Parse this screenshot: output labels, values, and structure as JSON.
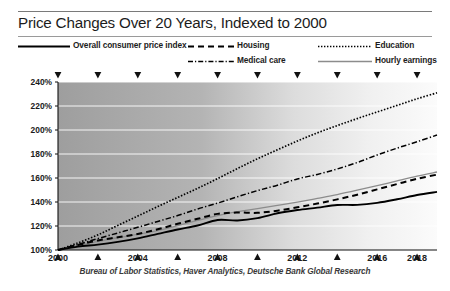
{
  "header": {
    "title": "Price Changes Over 20 Years, Indexed to 2000"
  },
  "legend": {
    "items": [
      {
        "key": "cpi",
        "label": "Overall consumer price index",
        "style": "solid-thick",
        "color": "#000000",
        "icon": "line-solid-icon"
      },
      {
        "key": "housing",
        "label": "Housing",
        "style": "dashed",
        "color": "#000000",
        "icon": "line-dashed-icon"
      },
      {
        "key": "medical",
        "label": "Medical care",
        "style": "dash-dot",
        "color": "#000000",
        "icon": "line-dash-dot-icon"
      },
      {
        "key": "edu",
        "label": "Education",
        "style": "dotted",
        "color": "#000000",
        "icon": "line-dotted-icon"
      },
      {
        "key": "hourly",
        "label": "Hourly earnings",
        "style": "solid-thin",
        "color": "#8c8c8c",
        "icon": "line-solid-gray-icon"
      }
    ]
  },
  "source": "Bureau of Labor Statistics, Haver Analytics, Deutsche Bank Global Research",
  "chart_data": {
    "type": "line",
    "title": "Price Changes Over 20 Years, Indexed to 2000",
    "xlabel": "",
    "ylabel": "",
    "xlim": [
      2000,
      2019
    ],
    "ylim": [
      100,
      240
    ],
    "ytick_values": [
      100,
      120,
      140,
      160,
      180,
      200,
      220,
      240
    ],
    "ytick_labels": [
      "100%",
      "120%",
      "140%",
      "160%",
      "180%",
      "200%",
      "220%",
      "240%"
    ],
    "xtick_values": [
      2000,
      2004,
      2008,
      2012,
      2016,
      2018
    ],
    "xtick_labels": [
      "2000",
      "2004",
      "2008",
      "2012",
      "2016",
      "2018"
    ],
    "x_minor_ticks": [
      2001,
      2002,
      2003,
      2005,
      2006,
      2007,
      2009,
      2010,
      2011,
      2013,
      2014,
      2015,
      2017,
      2019
    ],
    "top_marker_years": [
      2000,
      2002,
      2004,
      2006,
      2008,
      2010,
      2012,
      2014,
      2016,
      2018
    ],
    "grid": "horizontal",
    "legend_position": "top",
    "background": "horizontal-gradient-gray-to-white",
    "x": [
      2000,
      2001,
      2002,
      2003,
      2004,
      2005,
      2006,
      2007,
      2008,
      2009,
      2010,
      2011,
      2012,
      2013,
      2014,
      2015,
      2016,
      2017,
      2018,
      2019
    ],
    "series": [
      {
        "name": "Overall consumer price index",
        "style": "solid-thick",
        "color": "#000000",
        "values": [
          100,
          102.8,
          104.5,
          106.8,
          109.7,
          113.4,
          117.1,
          120.4,
          125.0,
          124.6,
          126.6,
          130.6,
          133.3,
          135.3,
          137.5,
          137.6,
          139.3,
          142.3,
          145.8,
          148.4
        ]
      },
      {
        "name": "Housing",
        "style": "dashed",
        "color": "#000000",
        "values": [
          100,
          104.2,
          108.0,
          110.6,
          113.4,
          117.3,
          121.8,
          126.0,
          130.1,
          131.2,
          131.0,
          132.8,
          135.6,
          138.7,
          142.2,
          146.1,
          150.5,
          155.0,
          159.3,
          162.8
        ]
      },
      {
        "name": "Medical care",
        "style": "dash-dot",
        "color": "#000000",
        "values": [
          100,
          104.6,
          109.5,
          114.2,
          118.9,
          123.8,
          128.7,
          134.2,
          139.1,
          144.4,
          149.5,
          154.0,
          159.2,
          163.0,
          167.5,
          172.9,
          179.2,
          184.9,
          190.2,
          195.8
        ]
      },
      {
        "name": "Education",
        "style": "dotted",
        "color": "#000000",
        "values": [
          100,
          105.9,
          112.6,
          120.5,
          128.3,
          136.2,
          143.8,
          151.4,
          159.5,
          167.9,
          176.0,
          183.5,
          190.8,
          197.6,
          203.7,
          209.5,
          215.0,
          220.5,
          226.0,
          231.0
        ]
      },
      {
        "name": "Hourly earnings",
        "style": "solid-thin",
        "color": "#8c8c8c",
        "values": [
          100,
          103.8,
          107.2,
          110.2,
          113.0,
          116.2,
          120.3,
          124.6,
          128.6,
          131.9,
          134.4,
          137.1,
          139.9,
          143.0,
          146.2,
          149.8,
          153.6,
          157.6,
          161.5,
          165.0
        ]
      }
    ]
  }
}
